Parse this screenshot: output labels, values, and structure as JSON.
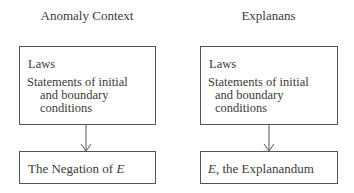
{
  "columns": [
    {
      "heading": "Anomaly Context",
      "top_box": {
        "laws": "Laws",
        "statements_line1": "Statements of initial",
        "statements_line2": "and boundary",
        "statements_line3": "conditions"
      },
      "bottom_box": {
        "prefix": "The Negation of ",
        "var": "E",
        "suffix": ""
      }
    },
    {
      "heading": "Explanans",
      "top_box": {
        "laws": "Laws",
        "statements_line1": "Statements of initial",
        "statements_line2": "and boundary",
        "statements_line3": "conditions"
      },
      "bottom_box": {
        "prefix": "",
        "var": "E",
        "suffix": ", the Explanandum"
      }
    }
  ]
}
